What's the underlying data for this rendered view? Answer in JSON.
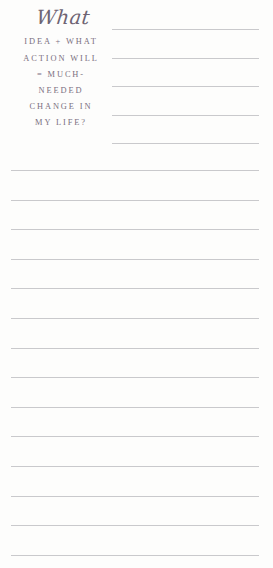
{
  "page": {
    "background_color": "#fdfdfc",
    "width": 273,
    "height": 568,
    "type": "journal-prompt-page"
  },
  "prompt": {
    "script_word": "What",
    "caps_lines": [
      "IDEA + WHAT",
      "ACTION WILL",
      "= MUCH-",
      "NEEDED",
      "CHANGE IN",
      "MY LIFE?"
    ],
    "full_text": "What idea + what action will = much-needed change in my life?",
    "text_color": "#7b7080",
    "script_color": "#6e6473"
  },
  "ruled_lines": {
    "color": "#c9c9cc",
    "short": {
      "count": 5,
      "left": 112,
      "width": 147,
      "y_positions": [
        29,
        57.5,
        86,
        114.5,
        143
      ]
    },
    "full": {
      "count": 14,
      "left": 11,
      "width": 248,
      "y_positions": [
        170,
        199.6,
        229.2,
        258.8,
        288.4,
        318,
        347.6,
        377.2,
        406.8,
        436.4,
        466,
        495.6,
        525.2,
        554.8
      ]
    }
  }
}
